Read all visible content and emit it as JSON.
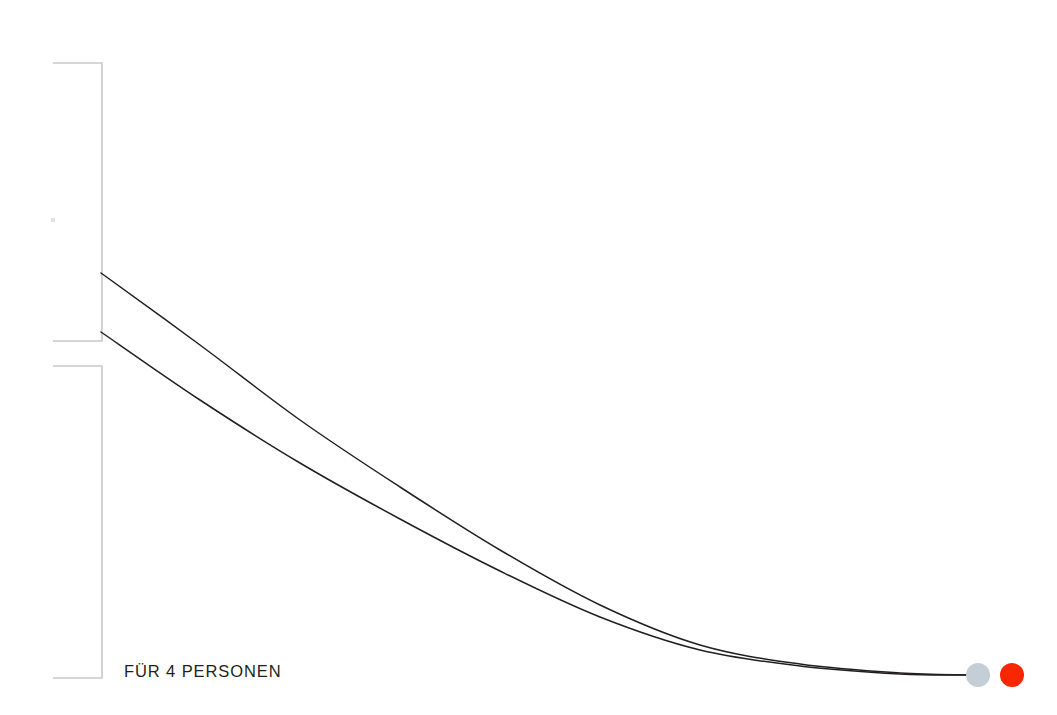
{
  "page": {
    "background_color": "#ffffff",
    "width": 1057,
    "height": 715
  },
  "diagram": {
    "title_fragment": "g",
    "label_main": "FÜR 4 PERSONEN",
    "bracket_color": "#c9c9c9",
    "curve_color": "#231f20",
    "tick_color": "#e2e2e2",
    "brackets": [
      {
        "name": "bracket-upper",
        "x": 102,
        "y_top": 63,
        "y_bottom": 341,
        "arm_left": 53
      },
      {
        "name": "bracket-lower",
        "x": 102,
        "y_top": 366,
        "y_bottom": 678,
        "arm_left": 53
      }
    ],
    "curves": [
      {
        "name": "curve-upper",
        "start_x": 101,
        "start_y": 273,
        "end_x": 966,
        "end_y": 675
      },
      {
        "name": "curve-lower",
        "start_x": 101,
        "start_y": 332,
        "end_x": 966,
        "end_y": 675
      }
    ],
    "markers": [
      {
        "name": "marker-gray",
        "cx": 978,
        "cy": 675,
        "r": 12,
        "color": "#c3ced6"
      },
      {
        "name": "marker-red",
        "cx": 1012,
        "cy": 675,
        "r": 12,
        "color": "#fa2600"
      }
    ],
    "tick": {
      "cx": 53,
      "cy": 220,
      "size": 4
    }
  },
  "chart_data": {
    "type": "line",
    "title": "FÜR 4 PERSONEN",
    "xlabel": "",
    "ylabel": "",
    "grid": false,
    "legend": "none",
    "series": [
      {
        "name": "curve-upper",
        "points": [
          [
            101,
            273
          ],
          [
            200,
            345
          ],
          [
            300,
            420
          ],
          [
            400,
            487
          ],
          [
            500,
            550
          ],
          [
            600,
            605
          ],
          [
            700,
            645
          ],
          [
            800,
            664
          ],
          [
            900,
            673
          ],
          [
            966,
            675
          ]
        ]
      },
      {
        "name": "curve-lower",
        "points": [
          [
            101,
            332
          ],
          [
            200,
            400
          ],
          [
            300,
            463
          ],
          [
            400,
            519
          ],
          [
            500,
            571
          ],
          [
            600,
            617
          ],
          [
            700,
            650
          ],
          [
            800,
            666
          ],
          [
            900,
            674
          ],
          [
            966,
            675
          ]
        ]
      }
    ],
    "annotations": [
      {
        "text": "FÜR 4 PERSONEN",
        "x": 124,
        "y": 670
      }
    ],
    "markers": [
      {
        "label": "gray-endpoint",
        "x": 978,
        "y": 675,
        "color": "#c3ced6"
      },
      {
        "label": "red-endpoint",
        "x": 1012,
        "y": 675,
        "color": "#fa2600"
      }
    ]
  }
}
